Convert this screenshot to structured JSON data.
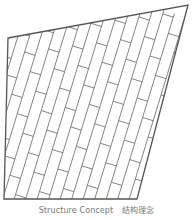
{
  "diagram": {
    "type": "structure-concept",
    "outline": [
      [
        8,
        38
      ],
      [
        188,
        5
      ],
      [
        137,
        199
      ],
      [
        4,
        199
      ]
    ],
    "stroke_color": "#555555",
    "pattern": "diagonal-staggered-planks"
  },
  "caption": {
    "english": "Structure Concept",
    "chinese": "结构理念"
  }
}
